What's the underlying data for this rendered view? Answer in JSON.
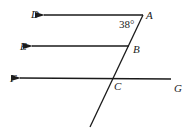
{
  "diagram": {
    "points": {
      "A": "A",
      "B": "B",
      "C": "C",
      "D": "D",
      "E": "E",
      "F": "F",
      "G": "G"
    },
    "angle_label": "38°",
    "stroke_color": "#1a1a1a"
  }
}
